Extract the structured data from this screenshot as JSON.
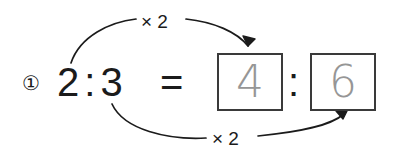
{
  "problem": {
    "item_number": "①",
    "left_ratio": {
      "antecedent": "2",
      "separator": ":",
      "consequent": "3"
    },
    "equals_sign": "=",
    "right_ratio": {
      "antecedent_answer": "4",
      "separator": ":",
      "consequent_answer": "6"
    },
    "annotations": {
      "top_operation": "× 2",
      "bottom_operation": "× 2"
    }
  },
  "colors": {
    "ink": "#1b1b1b",
    "answer_gray": "#969696",
    "box_border": "#3a3a3a",
    "background": "#ffffff"
  }
}
